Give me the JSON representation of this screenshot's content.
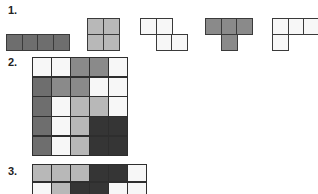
{
  "colors": {
    "white": "#f7f7f7",
    "light": "#b8b8b8",
    "mid": "#8a8a8a",
    "dark": "#6e6e6e",
    "black": "#353535",
    "line": "#3a3a3a"
  },
  "sections": [
    {
      "label": "1.",
      "pieces": [
        {
          "name": "I-tetromino",
          "color": "dark",
          "cells": [
            [
              0,
              0
            ],
            [
              1,
              0
            ],
            [
              2,
              0
            ],
            [
              3,
              0
            ]
          ]
        },
        {
          "name": "O-tetromino",
          "color": "light",
          "cells": [
            [
              0,
              0
            ],
            [
              1,
              0
            ],
            [
              0,
              1
            ],
            [
              1,
              1
            ]
          ]
        },
        {
          "name": "Z-tetromino",
          "color": "white",
          "cells": [
            [
              0,
              0
            ],
            [
              1,
              0
            ],
            [
              1,
              1
            ],
            [
              2,
              1
            ]
          ]
        },
        {
          "name": "T-tetromino",
          "color": "mid",
          "cells": [
            [
              0,
              0
            ],
            [
              1,
              0
            ],
            [
              2,
              0
            ],
            [
              1,
              1
            ]
          ]
        },
        {
          "name": "L-tetromino",
          "color": "white",
          "cells": [
            [
              0,
              0
            ],
            [
              1,
              0
            ],
            [
              2,
              0
            ],
            [
              0,
              1
            ]
          ]
        }
      ]
    },
    {
      "label": "2.",
      "grid": {
        "cols": 5,
        "rows": [
          [
            "white",
            "white",
            "mid",
            "mid",
            "white"
          ],
          [
            "dark",
            "mid",
            "mid",
            "white",
            "white"
          ],
          [
            "dark",
            "white",
            "light",
            "light",
            "white"
          ],
          [
            "dark",
            "white",
            "light",
            "black",
            "black"
          ],
          [
            "dark",
            "white",
            "light",
            "black",
            "black"
          ]
        ]
      }
    },
    {
      "label": "3.",
      "grid": {
        "cols": 6,
        "rows": [
          [
            "light",
            "light",
            "light",
            "black",
            "black",
            "white"
          ],
          [
            "white",
            "light",
            "black",
            "black",
            "white",
            "white"
          ]
        ]
      }
    }
  ]
}
